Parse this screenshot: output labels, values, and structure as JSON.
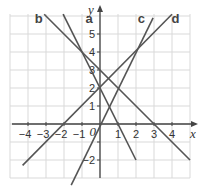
{
  "chart_data": {
    "type": "line",
    "title": "",
    "xlabel": "x",
    "ylabel": "y",
    "xlim": [
      -5.5,
      5.5
    ],
    "ylim": [
      -3.7,
      6.9
    ],
    "grid": true,
    "x_ticks": [
      -4,
      -3,
      -2,
      -1,
      1,
      2,
      3,
      4
    ],
    "y_ticks": [
      -2,
      -1,
      1,
      2,
      3,
      4,
      5
    ],
    "origin_label": "0",
    "series": [
      {
        "name": "a",
        "equation": "y = -2x + 2",
        "slope": -2,
        "intercept": 2,
        "points": [
          [
            -2.05,
            6.1
          ],
          [
            2.0,
            -2.0
          ]
        ],
        "label_pos": [
          -0.6,
          5.6
        ]
      },
      {
        "name": "b",
        "equation": "y = -x + 3",
        "slope": -1,
        "intercept": 3,
        "points": [
          [
            -3.1,
            6.1
          ],
          [
            5.0,
            -2.0
          ]
        ],
        "label_pos": [
          -3.4,
          5.6
        ]
      },
      {
        "name": "c",
        "equation": "y = 2x",
        "slope": 2,
        "intercept": 0,
        "points": [
          [
            -1.6,
            -3.4
          ],
          [
            2.95,
            5.9
          ]
        ],
        "label_pos": [
          2.3,
          5.6
        ]
      },
      {
        "name": "d",
        "equation": "y = x + 2",
        "slope": 1,
        "intercept": 2,
        "points": [
          [
            -4.3,
            -2.3
          ],
          [
            4.0,
            6.1
          ]
        ],
        "label_pos": [
          4.2,
          5.6
        ]
      }
    ],
    "colors": {
      "lines": "#555555",
      "grid": "#d8d8d8",
      "axes": "#444444"
    }
  },
  "labels": {
    "x_axis": "x",
    "y_axis": "y",
    "origin": "0",
    "line_a": "a",
    "line_b": "b",
    "line_c": "c",
    "line_d": "d",
    "x_ticks": [
      "−4",
      "−3",
      "−2",
      "−1",
      "1",
      "2",
      "3",
      "4"
    ],
    "y_ticks": [
      "5",
      "4",
      "3",
      "2",
      "1",
      "−2"
    ]
  }
}
